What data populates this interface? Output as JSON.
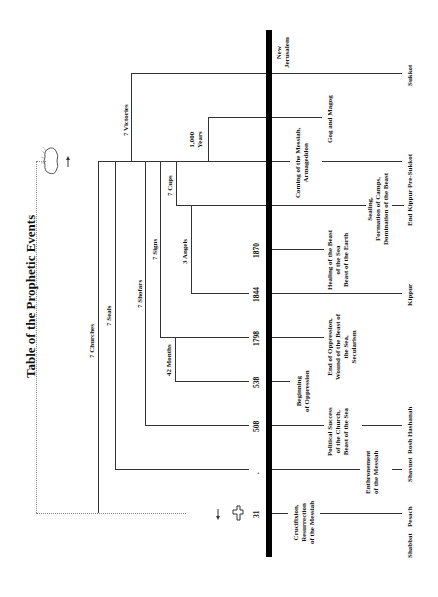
{
  "title": "Table of the Prophetic Events",
  "years": {
    "y31": "31",
    "y508": "508",
    "y538": "538",
    "y1798": "1798",
    "y1844": "1844",
    "y1870": "1870",
    "unlabeled_dot": "."
  },
  "periods": {
    "churches": "7 Churches",
    "seals": "7 Seals",
    "shofars": "7 Shofars",
    "signs": "7 Signs",
    "months": "42 Months",
    "cups": "7 Cups",
    "angels": "3 Angels",
    "victories": "7 Victories",
    "millennium_1": "1,000",
    "millennium_2": "Years"
  },
  "events": {
    "new_jerusalem_1": "New",
    "new_jerusalem_2": "Jerusalem",
    "gog_magog": "Gog and Magog",
    "coming_1": "Coming of the Messiah,",
    "coming_2": "Armageddon",
    "sealing_1": "Sealing,",
    "sealing_2": "Formation of Camps,",
    "sealing_3": "Domination of the Beast",
    "healing_1": "Healing of the Beast",
    "healing_2": "of the Sea",
    "healing_3": "Beast of the Earth",
    "end_oppression_1": "End of Oppression,",
    "end_oppression_2": "Wound of the Beast of",
    "end_oppression_3": "the Sea,",
    "end_oppression_4": "Secularism",
    "beginning_1": "Beginning",
    "beginning_2": "of Oppression",
    "political_1": "Political Success",
    "political_2": "of the Church,",
    "political_3": "Beast of the Sea",
    "enthronement_1": "Enthronement",
    "enthronement_2": "of the Messiah",
    "crucifixion_1": "Crucifixion,",
    "crucifixion_2": "Resurrection",
    "crucifixion_3": "of the Messiah"
  },
  "feasts": {
    "sukkot": "Sukkot",
    "pre_sukkot": "Pre-Sukkot",
    "end_kippur": "End Kippur",
    "kippur": "Kippur",
    "rosh_hashanah": "Rosh Hashanah",
    "shavuot": "Shavuot",
    "pesach": "Pesach",
    "shabbat": "Shabbat"
  },
  "icons": {
    "cloud": "cloud-icon",
    "cross": "cross-icon"
  },
  "colors": {
    "line": "#333333",
    "bar": "#000000",
    "dotted": "#888888"
  }
}
